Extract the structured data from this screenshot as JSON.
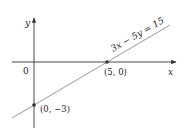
{
  "diagram": {
    "type": "coordinate-graph",
    "axes": {
      "x_label": "x",
      "y_label": "y",
      "origin_label": "0"
    },
    "line": {
      "equation": "3x − 5y = 15",
      "color": "#9a9a9a"
    },
    "points": [
      {
        "label": "(5, 0)",
        "x": 5,
        "y": 0
      },
      {
        "label": "(0, −3)",
        "x": 0,
        "y": -3
      }
    ],
    "colors": {
      "axis": "#333333",
      "line": "#9a9a9a",
      "point": "#333333"
    }
  }
}
